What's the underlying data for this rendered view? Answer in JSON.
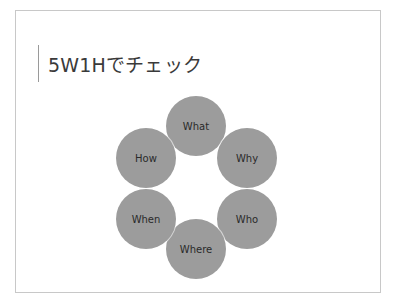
{
  "slide": {
    "title": "5W1Hでチェック"
  },
  "diagram": {
    "type": "cycle",
    "circle_color": "#9c9c9c",
    "items": [
      {
        "label": "What",
        "cx": 196,
        "cy": 126
      },
      {
        "label": "Why",
        "cx": 247,
        "cy": 158
      },
      {
        "label": "Who",
        "cx": 247,
        "cy": 219
      },
      {
        "label": "Where",
        "cx": 196,
        "cy": 249
      },
      {
        "label": "When",
        "cx": 146,
        "cy": 219
      },
      {
        "label": "How",
        "cx": 146,
        "cy": 158
      }
    ]
  }
}
